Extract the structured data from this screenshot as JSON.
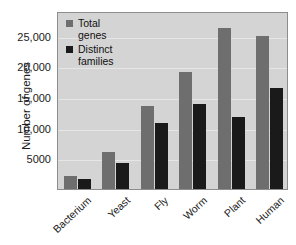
{
  "chart_data": {
    "type": "bar",
    "title": "",
    "xlabel": "",
    "ylabel": "Number of genes",
    "ylim": [
      0,
      29000
    ],
    "yticks": [
      5000,
      10000,
      15000,
      20000,
      25000
    ],
    "ytick_labels": [
      "5000",
      "10,000",
      "15,000",
      "20,000",
      "25,000"
    ],
    "grid": true,
    "legend_position": "top-left",
    "categories": [
      "Bacterium",
      "Yeast",
      "Fly",
      "Worm",
      "Plant",
      "Human"
    ],
    "series": [
      {
        "name": "Total genes",
        "color": "#6e6e6e",
        "values": [
          2100,
          6000,
          13500,
          19000,
          26300,
          25000
        ]
      },
      {
        "name": "Distinct families",
        "color": "#1a1a1a",
        "values": [
          1700,
          4200,
          10800,
          13800,
          11700,
          16400
        ]
      }
    ]
  },
  "legend": {
    "items": [
      {
        "label_line1": "Total",
        "label_line2": "genes",
        "swatch": "gray-square"
      },
      {
        "label_line1": "Distinct",
        "label_line2": "families",
        "swatch": "black-square"
      }
    ]
  },
  "colors": {
    "plot_background": "#d4d4d4",
    "gridline": "#e6e6e6",
    "plot_border": "#8d8d8d",
    "total_genes_bar": "#6e6e6e",
    "distinct_families_bar": "#1a1a1a",
    "text": "#1b1b1b",
    "page_background": "#ffffff"
  }
}
